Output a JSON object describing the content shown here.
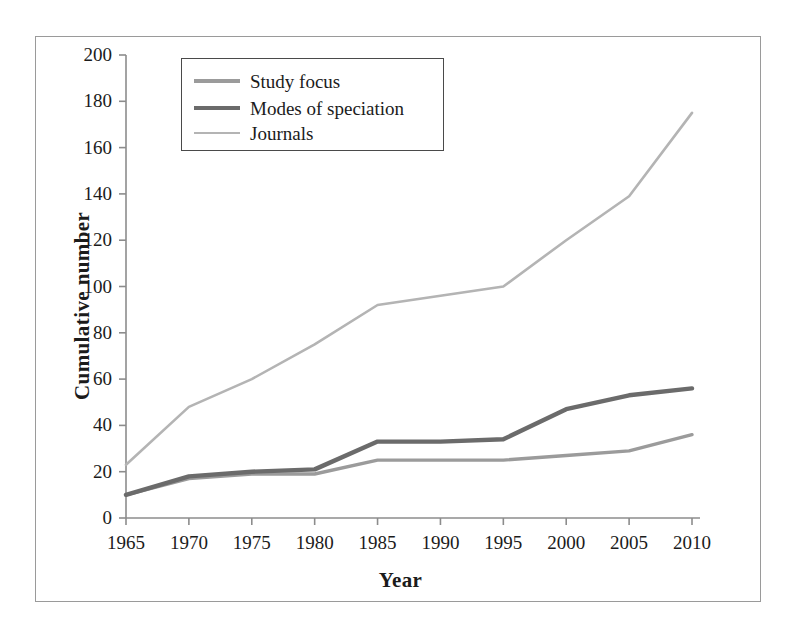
{
  "chart_data": {
    "type": "line",
    "title": "",
    "xlabel": "Year",
    "ylabel": "Cumulative number",
    "x": [
      1965,
      1970,
      1975,
      1980,
      1985,
      1990,
      1995,
      2000,
      2005,
      2010
    ],
    "categories": [
      "1965",
      "1970",
      "1975",
      "1980",
      "1985",
      "1990",
      "1995",
      "2000",
      "2005",
      "2010"
    ],
    "xlim": [
      1965,
      2010
    ],
    "ylim": [
      0,
      200
    ],
    "ytick_step": 20,
    "yticks": [
      0,
      20,
      40,
      60,
      80,
      100,
      120,
      140,
      160,
      180,
      200
    ],
    "ytick_labels": [
      "0",
      "20",
      "40",
      "60",
      "80",
      "100",
      "120",
      "140",
      "160",
      "180",
      "200"
    ],
    "grid": false,
    "legend_position": "upper left",
    "series": [
      {
        "name": "Study focus",
        "values": [
          10,
          17,
          19,
          19,
          25,
          25,
          25,
          27,
          29,
          36
        ],
        "color": "#9b9b9b",
        "width": 3.4
      },
      {
        "name": "Modes of speciation",
        "values": [
          10,
          18,
          20,
          21,
          33,
          33,
          34,
          47,
          53,
          56
        ],
        "color": "#6b6b6b",
        "width": 4.4
      },
      {
        "name": "Journals",
        "values": [
          23,
          48,
          60,
          75,
          92,
          96,
          100,
          120,
          139,
          175
        ],
        "color": "#b4b4b4",
        "width": 2.6
      }
    ]
  },
  "axes": {
    "y_title": "Cumulative number",
    "x_title": "Year"
  },
  "legend": {
    "items": [
      {
        "label": "Study focus"
      },
      {
        "label": "Modes of speciation"
      },
      {
        "label": "Journals"
      }
    ]
  },
  "colors": {
    "axis": "#8c8c8c",
    "text": "#1b1b1b",
    "frame": "#9a9a9a",
    "legend_border": "#4a4a4a"
  }
}
